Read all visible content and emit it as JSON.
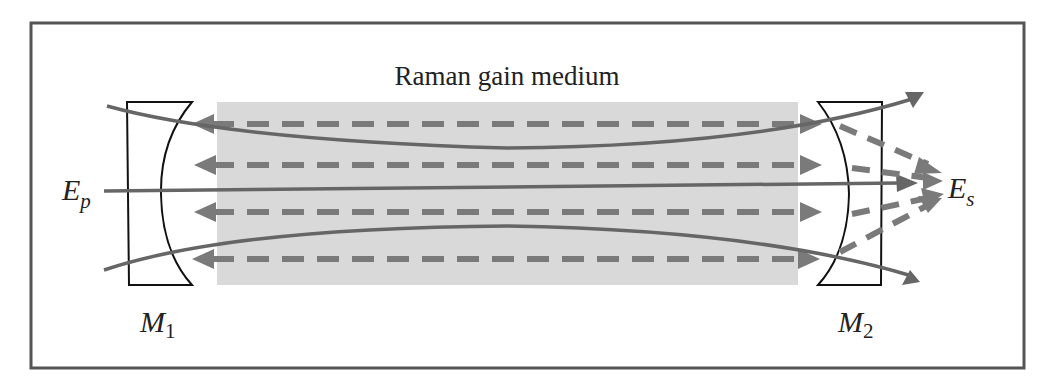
{
  "title": "Raman gain medium",
  "labels": {
    "pump_main": "E",
    "pump_sub": "p",
    "stokes_main": "E",
    "stokes_sub": "s",
    "mirror1_main": "M",
    "mirror1_sub": "1",
    "mirror2_main": "M",
    "mirror2_sub": "2"
  },
  "colors": {
    "frame": "#555555",
    "gain_medium": "#d9d9d9",
    "beam": "#666666",
    "stokes_arrow": "#7a7a7a",
    "mirror_outline": "#111111",
    "text": "#222222"
  },
  "components": {
    "gain_medium": "Raman gain medium (shaded rectangle)",
    "mirror_left": "M1 concave input mirror",
    "mirror_right": "M2 concave output mirror",
    "pump_beam": "Ep pump beam (solid line, passes through cavity)",
    "stokes_beams": "Es Stokes beams (dashed bidirectional arrows, 4 lines)",
    "beam_envelope": "Focused beam envelope (curved solid lines)"
  }
}
